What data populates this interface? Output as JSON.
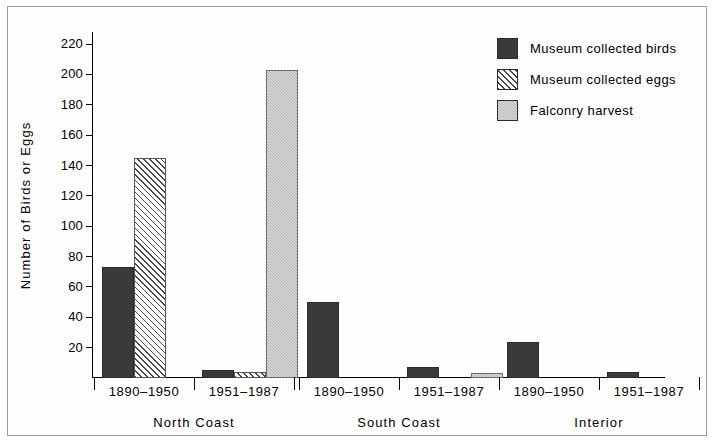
{
  "chart_data": {
    "type": "bar",
    "title": "",
    "xlabel": "",
    "ylabel": "Number of Birds or Eggs",
    "ylim": [
      0,
      228
    ],
    "yticks": [
      20,
      40,
      60,
      80,
      100,
      120,
      140,
      160,
      180,
      200,
      220
    ],
    "grid": false,
    "legend_position": "top-right",
    "groups": [
      {
        "name": "North Coast",
        "categories": [
          "1890–1950",
          "1951–1987"
        ]
      },
      {
        "name": "South Coast",
        "categories": [
          "1890–1950",
          "1951–1987"
        ]
      },
      {
        "name": "Interior",
        "categories": [
          "1890–1950",
          "1951–1987"
        ]
      }
    ],
    "categories": [
      "North Coast 1890–1950",
      "North Coast 1951–1987",
      "South Coast 1890–1950",
      "South Coast 1951–1987",
      "Interior 1890–1950",
      "Interior 1951–1987"
    ],
    "series": [
      {
        "name": "Museum collected birds",
        "fill": "solid-dark",
        "color": "#3a3a3a",
        "values": [
          73,
          5,
          50,
          7,
          24,
          4
        ]
      },
      {
        "name": "Museum collected eggs",
        "fill": "hatch",
        "color": "#ffffff",
        "values": [
          145,
          4,
          0,
          0,
          0,
          0
        ]
      },
      {
        "name": "Falconry harvest",
        "fill": "gray",
        "color": "#b4b4b4",
        "values": [
          0,
          203,
          0,
          3,
          0,
          0
        ]
      }
    ]
  },
  "legend": {
    "items": [
      {
        "label": "Museum collected birds",
        "swatch": "solid-dark"
      },
      {
        "label": "Museum collected eggs",
        "swatch": "hatch"
      },
      {
        "label": "Falconry harvest",
        "swatch": "gray"
      }
    ]
  },
  "axis": {
    "y_title": "Number of Birds or Eggs",
    "y_tick_labels": [
      "220",
      "200",
      "180",
      "160",
      "140",
      "120",
      "100",
      "80",
      "60",
      "40",
      "20"
    ],
    "x_category_labels": [
      "1890–1950",
      "1951–1987",
      "1890–1950",
      "1951–1987",
      "1890–1950",
      "1951–1987"
    ],
    "x_group_labels": [
      "North Coast",
      "South Coast",
      "Interior"
    ]
  }
}
